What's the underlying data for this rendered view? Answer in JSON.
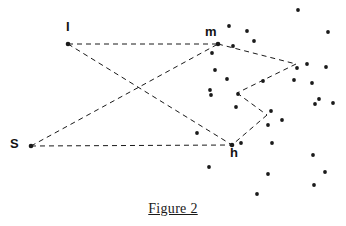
{
  "figure": {
    "caption": "Figure 2",
    "background_color": "#ffffff",
    "ink_color": "#1a1a1a",
    "dot_color": "#1a1a1a",
    "line_style": "dashed",
    "labels": [
      {
        "name": "I",
        "text": "I",
        "x": 66,
        "y": 20
      },
      {
        "name": "m",
        "text": "m",
        "x": 205,
        "y": 25
      },
      {
        "name": "S",
        "text": "S",
        "x": 10,
        "y": 137
      },
      {
        "name": "h",
        "text": "h",
        "x": 230,
        "y": 146
      }
    ],
    "vertices": [
      {
        "name": "I",
        "x": 68,
        "y": 44
      },
      {
        "name": "m",
        "x": 218,
        "y": 44
      },
      {
        "name": "S",
        "x": 31,
        "y": 146
      },
      {
        "name": "h",
        "x": 232,
        "y": 145
      }
    ],
    "edges": [
      {
        "name": "I-to-m",
        "from": [
          68,
          44
        ],
        "to": [
          218,
          44
        ]
      },
      {
        "name": "I-to-h",
        "from": [
          68,
          44
        ],
        "to": [
          232,
          145
        ]
      },
      {
        "name": "S-to-m",
        "from": [
          31,
          146
        ],
        "to": [
          218,
          44
        ]
      },
      {
        "name": "S-to-h",
        "from": [
          31,
          146
        ],
        "to": [
          232,
          145
        ]
      },
      {
        "name": "m-to-east",
        "from": [
          218,
          44
        ],
        "to": [
          296,
          64
        ]
      },
      {
        "name": "east-to-mid",
        "from": [
          296,
          64
        ],
        "to": [
          237,
          93
        ]
      },
      {
        "name": "mid-to-lower",
        "from": [
          237,
          93
        ],
        "to": [
          267,
          115
        ]
      },
      {
        "name": "lower-to-h",
        "from": [
          267,
          115
        ],
        "to": [
          232,
          145
        ]
      }
    ],
    "dots": [
      {
        "x": 298,
        "y": 10
      },
      {
        "x": 229,
        "y": 26
      },
      {
        "x": 247,
        "y": 31
      },
      {
        "x": 328,
        "y": 32
      },
      {
        "x": 254,
        "y": 41
      },
      {
        "x": 233,
        "y": 46
      },
      {
        "x": 212,
        "y": 53
      },
      {
        "x": 307,
        "y": 64
      },
      {
        "x": 297,
        "y": 68
      },
      {
        "x": 326,
        "y": 67
      },
      {
        "x": 215,
        "y": 70
      },
      {
        "x": 227,
        "y": 79
      },
      {
        "x": 263,
        "y": 81
      },
      {
        "x": 294,
        "y": 80
      },
      {
        "x": 312,
        "y": 83
      },
      {
        "x": 210,
        "y": 90
      },
      {
        "x": 211,
        "y": 95
      },
      {
        "x": 238,
        "y": 94
      },
      {
        "x": 319,
        "y": 99
      },
      {
        "x": 333,
        "y": 103
      },
      {
        "x": 236,
        "y": 107
      },
      {
        "x": 271,
        "y": 111
      },
      {
        "x": 315,
        "y": 104
      },
      {
        "x": 282,
        "y": 120
      },
      {
        "x": 197,
        "y": 133
      },
      {
        "x": 268,
        "y": 125
      },
      {
        "x": 241,
        "y": 143
      },
      {
        "x": 272,
        "y": 143
      },
      {
        "x": 313,
        "y": 155
      },
      {
        "x": 209,
        "y": 167
      },
      {
        "x": 268,
        "y": 174
      },
      {
        "x": 325,
        "y": 172
      },
      {
        "x": 257,
        "y": 194
      },
      {
        "x": 314,
        "y": 185
      }
    ]
  }
}
